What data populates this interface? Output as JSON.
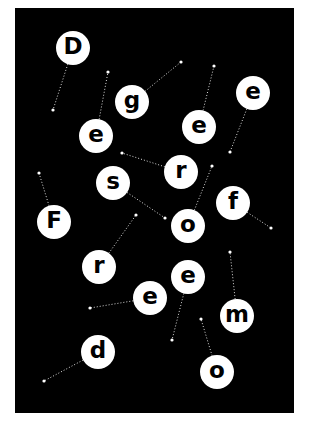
{
  "poster": {
    "background": "#000000",
    "page_background": "#ffffff",
    "bubble_color": "#ffffff",
    "letter_color": "#000000",
    "letters": [
      {
        "char": "D",
        "x": 73,
        "y": 48,
        "line_to": [
          53,
          110
        ]
      },
      {
        "char": "g",
        "x": 132,
        "y": 102,
        "line_to": [
          181,
          62
        ]
      },
      {
        "char": "e",
        "x": 253,
        "y": 93,
        "line_to": [
          230,
          152
        ]
      },
      {
        "char": "e",
        "x": 96,
        "y": 136,
        "line_to": [
          108,
          72
        ]
      },
      {
        "char": "e",
        "x": 199,
        "y": 127,
        "line_to": [
          214,
          66
        ]
      },
      {
        "char": "r",
        "x": 181,
        "y": 172,
        "line_to": [
          122,
          153
        ]
      },
      {
        "char": "s",
        "x": 113,
        "y": 183,
        "line_to": [
          165,
          218
        ]
      },
      {
        "char": "f",
        "x": 233,
        "y": 203,
        "line_to": [
          271,
          228
        ]
      },
      {
        "char": "F",
        "x": 54,
        "y": 222,
        "line_to": [
          39,
          173
        ]
      },
      {
        "char": "o",
        "x": 188,
        "y": 226,
        "line_to": [
          212,
          166
        ]
      },
      {
        "char": "r",
        "x": 99,
        "y": 267,
        "line_to": [
          136,
          215
        ]
      },
      {
        "char": "e",
        "x": 188,
        "y": 277,
        "line_to": [
          172,
          340
        ]
      },
      {
        "char": "e",
        "x": 150,
        "y": 298,
        "line_to": [
          90,
          308
        ]
      },
      {
        "char": "m",
        "x": 237,
        "y": 316,
        "line_to": [
          230,
          252
        ]
      },
      {
        "char": "d",
        "x": 98,
        "y": 352,
        "line_to": [
          44,
          381
        ]
      },
      {
        "char": "o",
        "x": 217,
        "y": 372,
        "line_to": [
          201,
          319
        ]
      }
    ]
  }
}
